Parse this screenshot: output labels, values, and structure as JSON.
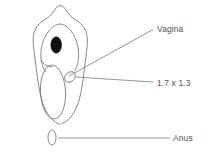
{
  "figure": {
    "type": "anatomical-line-diagram",
    "background_color": "#ffffff",
    "stroke_color": "#7a7a80",
    "fill_color": "#111111",
    "text_color": "#555558"
  },
  "labels": {
    "vagina": "Vagina",
    "measurement": "1.7 x 1.3",
    "anus": "Anus"
  },
  "shapes": {
    "outer_outline_name": "perineum-outline",
    "inner_outline_name": "labial-outline",
    "dark_ellipse_name": "clitoris-marker",
    "large_oval_name": "vestibule-oval",
    "small_oval_name": "vaginal-opening-oval",
    "anus_oval_name": "anus-oval"
  },
  "leader_lines": {
    "vagina_from": "70,76",
    "vagina_to": "153,30",
    "measurement_from": "76,77",
    "measurement_to": "153,82",
    "anus_from": "58,138",
    "anus_to": "170,138"
  }
}
